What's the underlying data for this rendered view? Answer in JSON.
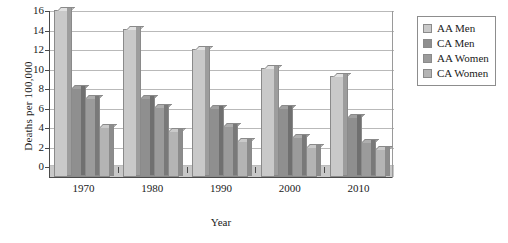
{
  "chart_data": {
    "type": "bar",
    "title": "",
    "xlabel": "Year",
    "ylabel": "Deaths per 100,000",
    "categories": [
      "1970",
      "1980",
      "1990",
      "2000",
      "2010"
    ],
    "ylim": [
      0,
      16
    ],
    "yticks": [
      0,
      2,
      4,
      6,
      8,
      10,
      12,
      14,
      16
    ],
    "ytick_labels": [
      "0",
      "2",
      "4",
      "6",
      "8",
      "10",
      "12",
      "14",
      "16"
    ],
    "grid": true,
    "legend_position": "right",
    "series": [
      {
        "name": "AA Men",
        "color": "#c9c9c9",
        "values": [
          16.0,
          14.1,
          12.0,
          10.1,
          9.2
        ]
      },
      {
        "name": "CA Men",
        "color": "#8f8f8f",
        "values": [
          8.0,
          7.0,
          6.0,
          6.0,
          5.0
        ]
      },
      {
        "name": "AA Women",
        "color": "#9b9b9b",
        "values": [
          7.0,
          6.1,
          4.1,
          3.0,
          2.5
        ]
      },
      {
        "name": "CA Women",
        "color": "#b4b4b4",
        "values": [
          4.0,
          3.6,
          2.6,
          2.0,
          1.7
        ]
      }
    ]
  },
  "axis": {
    "ylabel": "Deaths per 100,000",
    "xlabel": "Year"
  },
  "legend": {
    "items": [
      {
        "label": "AA Men"
      },
      {
        "label": "CA Men"
      },
      {
        "label": "AA Women"
      },
      {
        "label": "CA Women"
      }
    ]
  },
  "colors": {
    "aa_men": "#c9c9c9",
    "ca_men": "#8f8f8f",
    "aa_women": "#9b9b9b",
    "ca_women": "#b4b4b4",
    "axis": "#4a4a4a",
    "grid": "#b9b9b9",
    "floor": "#c8c8c8",
    "bar_outline": "#8a8a8a"
  }
}
